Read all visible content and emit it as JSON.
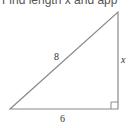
{
  "prompt": "Find length x and app",
  "diagram": {
    "type": "right-triangle",
    "labels": {
      "hypotenuse": "8",
      "vertical_side": "x",
      "base": "6"
    },
    "colors": {
      "stroke": "#888888",
      "text": "#333333"
    }
  }
}
